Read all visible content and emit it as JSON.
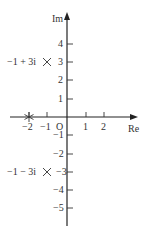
{
  "diagram": {
    "type": "complex-plane",
    "axes": {
      "x_label": "Re",
      "y_label": "Im",
      "origin_label": "O"
    },
    "x_ticks": [
      {
        "value": -2,
        "label": "−2"
      },
      {
        "value": -1,
        "label": "−1"
      },
      {
        "value": 1,
        "label": "1"
      },
      {
        "value": 2,
        "label": "2"
      }
    ],
    "y_ticks": [
      {
        "value": 4,
        "label": "4"
      },
      {
        "value": 3,
        "label": "3"
      },
      {
        "value": 2,
        "label": "2"
      },
      {
        "value": 1,
        "label": "1"
      },
      {
        "value": -1,
        "label": "−1"
      },
      {
        "value": -2,
        "label": "−2"
      },
      {
        "value": -3,
        "label": "−3"
      },
      {
        "value": -4,
        "label": "−4"
      },
      {
        "value": -5,
        "label": "−5"
      }
    ],
    "points": [
      {
        "re": -1,
        "im": 3,
        "marker": "cross",
        "label": "−1 + 3i"
      },
      {
        "re": -1,
        "im": -3,
        "marker": "cross",
        "label": "−1 − 3i"
      },
      {
        "re": -2,
        "im": 0,
        "marker": "asterisk",
        "label": ""
      }
    ]
  }
}
